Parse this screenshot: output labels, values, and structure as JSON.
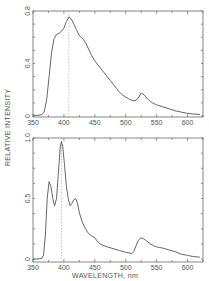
{
  "chart_data": [
    {
      "type": "line",
      "panel": "top",
      "title": "",
      "xlabel": "WAVELENGTH, nm",
      "ylabel": "RELATIVE INTENSITY",
      "xlim": [
        350,
        625
      ],
      "ylim": [
        0,
        0.8
      ],
      "xticks": [
        350,
        400,
        450,
        500,
        550,
        600
      ],
      "yticks_labeled": [
        0,
        0.4,
        0.8
      ],
      "ytick_labels": [
        "0",
        "0.4",
        "0.8"
      ],
      "xtick_labels": [
        "350",
        "400",
        "450",
        "500",
        "550",
        "600"
      ],
      "grid": false,
      "reference_line": {
        "x": 408,
        "style": "dashed"
      },
      "series": [
        {
          "name": "spectrum",
          "x": [
            350,
            358,
            364,
            368,
            372,
            376,
            380,
            384,
            388,
            392,
            396,
            400,
            404,
            408,
            412,
            416,
            420,
            424,
            428,
            432,
            436,
            440,
            445,
            450,
            455,
            460,
            465,
            470,
            475,
            480,
            485,
            490,
            495,
            500,
            505,
            510,
            515,
            520,
            525,
            530,
            535,
            540,
            545,
            550,
            560,
            570,
            580,
            590,
            600,
            610,
            620
          ],
          "values": [
            0.005,
            0.005,
            0.01,
            0.03,
            0.12,
            0.3,
            0.48,
            0.59,
            0.62,
            0.63,
            0.645,
            0.67,
            0.72,
            0.755,
            0.74,
            0.7,
            0.66,
            0.62,
            0.6,
            0.58,
            0.55,
            0.51,
            0.46,
            0.42,
            0.39,
            0.36,
            0.33,
            0.3,
            0.27,
            0.24,
            0.21,
            0.18,
            0.16,
            0.145,
            0.13,
            0.12,
            0.115,
            0.135,
            0.175,
            0.16,
            0.13,
            0.11,
            0.095,
            0.085,
            0.07,
            0.055,
            0.04,
            0.03,
            0.02,
            0.015,
            0.012
          ]
        }
      ]
    },
    {
      "type": "line",
      "panel": "bottom",
      "title": "",
      "xlabel": "WAVELENGTH, nm",
      "ylabel": "RELATIVE INTENSITY",
      "xlim": [
        350,
        625
      ],
      "ylim": [
        0,
        1.0
      ],
      "xticks": [
        350,
        400,
        450,
        500,
        550,
        600
      ],
      "yticks_labeled": [
        0,
        0.5,
        1.0
      ],
      "ytick_labels": [
        "0",
        "0.5",
        "1.0"
      ],
      "xtick_labels": [
        "350",
        "400",
        "450",
        "500",
        "550",
        "600"
      ],
      "grid": false,
      "reference_line": {
        "x": 396,
        "style": "dashed"
      },
      "series": [
        {
          "name": "spectrum",
          "x": [
            350,
            358,
            364,
            367,
            370,
            373,
            376,
            379,
            382,
            385,
            388,
            391,
            394,
            396,
            398,
            401,
            404,
            407,
            410,
            413,
            416,
            419,
            422,
            425,
            430,
            435,
            440,
            445,
            450,
            455,
            460,
            470,
            480,
            490,
            500,
            505,
            510,
            513,
            516,
            520,
            524,
            528,
            532,
            536,
            540,
            545,
            550,
            555,
            560,
            570,
            580,
            590,
            600,
            610,
            620
          ],
          "values": [
            0.0,
            0.0,
            0.005,
            0.03,
            0.2,
            0.5,
            0.64,
            0.6,
            0.5,
            0.44,
            0.5,
            0.7,
            0.92,
            0.97,
            0.93,
            0.78,
            0.6,
            0.5,
            0.44,
            0.46,
            0.49,
            0.5,
            0.46,
            0.38,
            0.3,
            0.25,
            0.21,
            0.19,
            0.175,
            0.14,
            0.12,
            0.1,
            0.085,
            0.07,
            0.055,
            0.05,
            0.045,
            0.06,
            0.1,
            0.15,
            0.175,
            0.17,
            0.155,
            0.14,
            0.125,
            0.11,
            0.1,
            0.095,
            0.09,
            0.075,
            0.06,
            0.04,
            0.03,
            0.02,
            0.015
          ]
        }
      ]
    }
  ],
  "figure": {
    "shared_xlabel": "WAVELENGTH, nm",
    "shared_ylabel": "RELATIVE INTENSITY",
    "line_color": "#555555",
    "axis_color": "#666666",
    "dashed_color": "#aaaaaa"
  }
}
